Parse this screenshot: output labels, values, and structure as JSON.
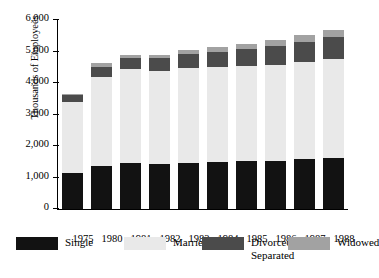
{
  "chart_data": {
    "type": "bar",
    "subtype": "stacked",
    "title": "",
    "xlabel": "",
    "ylabel": "Thousands of Employees",
    "ylim": [
      0,
      6000
    ],
    "ytick_values": [
      0,
      1000,
      2000,
      3000,
      4000,
      5000,
      6000
    ],
    "ytick_labels": [
      "0",
      "1,000",
      "2,000",
      "3,000",
      "4,000",
      "5,000",
      "6,000"
    ],
    "grid": false,
    "legend_position": "bottom",
    "categories": [
      "1975",
      "1980",
      "1981",
      "1982",
      "1983",
      "1984",
      "1985",
      "1986",
      "1987",
      "1988"
    ],
    "series": [
      {
        "name": "Single",
        "color": "#121212",
        "values": [
          1130,
          1380,
          1450,
          1440,
          1470,
          1490,
          1510,
          1530,
          1580,
          1620
        ]
      },
      {
        "name": "Married",
        "color": "#e9e9e9",
        "values": [
          2280,
          2800,
          2980,
          2950,
          3000,
          3020,
          3040,
          3040,
          3080,
          3130
        ]
      },
      {
        "name": "Divorced/\nSeparated",
        "color": "#4b4b4b",
        "values": [
          210,
          330,
          350,
          390,
          440,
          490,
          530,
          590,
          650,
          700
        ]
      },
      {
        "name": "Widowed",
        "color": "#a2a2a2",
        "values": [
          40,
          110,
          110,
          120,
          130,
          150,
          170,
          190,
          210,
          230
        ]
      }
    ],
    "totals": [
      3660,
      4620,
      4890,
      4900,
      5040,
      5150,
      5250,
      5350,
      5520,
      5680
    ],
    "annotations": []
  },
  "legend": {
    "items": [
      {
        "label": "Single",
        "color": "#121212"
      },
      {
        "label": "Married",
        "color": "#e9e9e9"
      },
      {
        "label": "Divorced/\nSeparated",
        "color": "#4b4b4b"
      },
      {
        "label": "Widowed",
        "color": "#a2a2a2"
      }
    ]
  },
  "caption": {
    "text": ""
  }
}
